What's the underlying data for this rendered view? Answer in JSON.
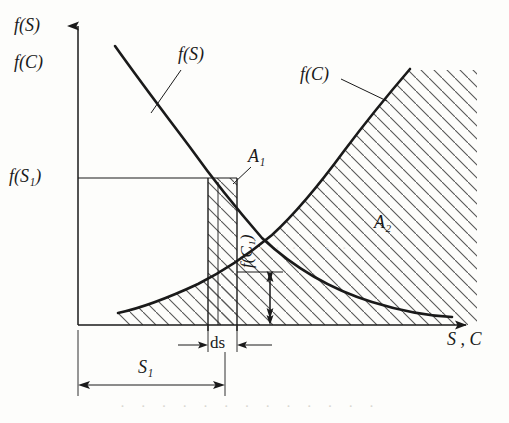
{
  "figure": {
    "kind": "economics-cost-supply-diagram",
    "background_color": "#fdfdfb",
    "ink_color": "#1a1a1a",
    "hatch_color": "#555555"
  },
  "axes": {
    "y_axis_top_labels": [
      {
        "name": "f-of-S",
        "text": "f(S)"
      },
      {
        "name": "f-of-C",
        "text": "f(C)"
      }
    ],
    "x_axis_label": "S , C",
    "y_tick_label": "f(S₁)",
    "y_tick_value_px": 178,
    "origin_px": [
      78,
      325
    ],
    "x_axis_end_px": [
      477,
      325
    ],
    "y_axis_top_px": [
      78,
      18
    ]
  },
  "curves": [
    {
      "name": "f(S)",
      "label": "f(S)",
      "label_pos_px": [
        178,
        45
      ],
      "leader_from_px": [
        182,
        72
      ],
      "leader_to_px": [
        152,
        112
      ],
      "description": "downward-sloping convex decreasing curve (supply price / marginal)",
      "points_px": [
        [
          115,
          46
        ],
        [
          140,
          80
        ],
        [
          165,
          112
        ],
        [
          190,
          147
        ],
        [
          212,
          180
        ],
        [
          238,
          212
        ],
        [
          262,
          238
        ],
        [
          290,
          262
        ],
        [
          320,
          282
        ],
        [
          352,
          297
        ],
        [
          386,
          307
        ],
        [
          420,
          313
        ],
        [
          450,
          316
        ]
      ]
    },
    {
      "name": "f(C)",
      "label": "f(C)",
      "label_pos_px": [
        300,
        65
      ],
      "leader_from_px": [
        341,
        78
      ],
      "leader_to_px": [
        386,
        100
      ],
      "description": "upward-sloping convex increasing curve (cost)",
      "points_px": [
        [
          118,
          313
        ],
        [
          142,
          306
        ],
        [
          168,
          297
        ],
        [
          196,
          285
        ],
        [
          222,
          272
        ],
        [
          248,
          256
        ],
        [
          272,
          236
        ],
        [
          296,
          212
        ],
        [
          320,
          184
        ],
        [
          344,
          152
        ],
        [
          368,
          120
        ],
        [
          390,
          92
        ],
        [
          410,
          70
        ]
      ]
    }
  ],
  "regions": [
    {
      "name": "A1",
      "label": "A₁",
      "label_pos_px": [
        248,
        147
      ],
      "leader_from_px": [
        250,
        166
      ],
      "leader_to_px": [
        234,
        182
      ],
      "hatched": true,
      "description": "narrow vertical hatched strip of width ds at S₁"
    },
    {
      "name": "A2",
      "label": "A₂",
      "label_pos_px": [
        374,
        213
      ],
      "hatched": true,
      "description": "large hatched area right of f(C) curve down to x-axis"
    }
  ],
  "strip": {
    "name": "ds-strip",
    "left_px": 208,
    "right_px": 237,
    "top_px": 178,
    "bottom_px": 325,
    "inner_line_px": 218
  },
  "dimensions": [
    {
      "name": "ds-dimension",
      "label": "ds",
      "label_pos_px": [
        210,
        334
      ],
      "y_px": 345,
      "from_px": 178,
      "to_px": 272
    },
    {
      "name": "S1-dimension",
      "label": "S₁",
      "label_pos_px": [
        138,
        358
      ],
      "y_px": 385,
      "from_px": 78,
      "to_px": 225
    },
    {
      "name": "fC1-dimension",
      "label": "f(C₁)",
      "label_pos_px": [
        238,
        268
      ],
      "x_px": 270,
      "top_px": 272,
      "bottom_px": 325
    }
  ],
  "bleedthrough": [
    {
      "name": "bleed-text-bottom",
      "text": "· · · · · · · · · · · · ·"
    },
    {
      "name": "bleed-text-middle",
      "text": "· · · · · ·"
    }
  ]
}
